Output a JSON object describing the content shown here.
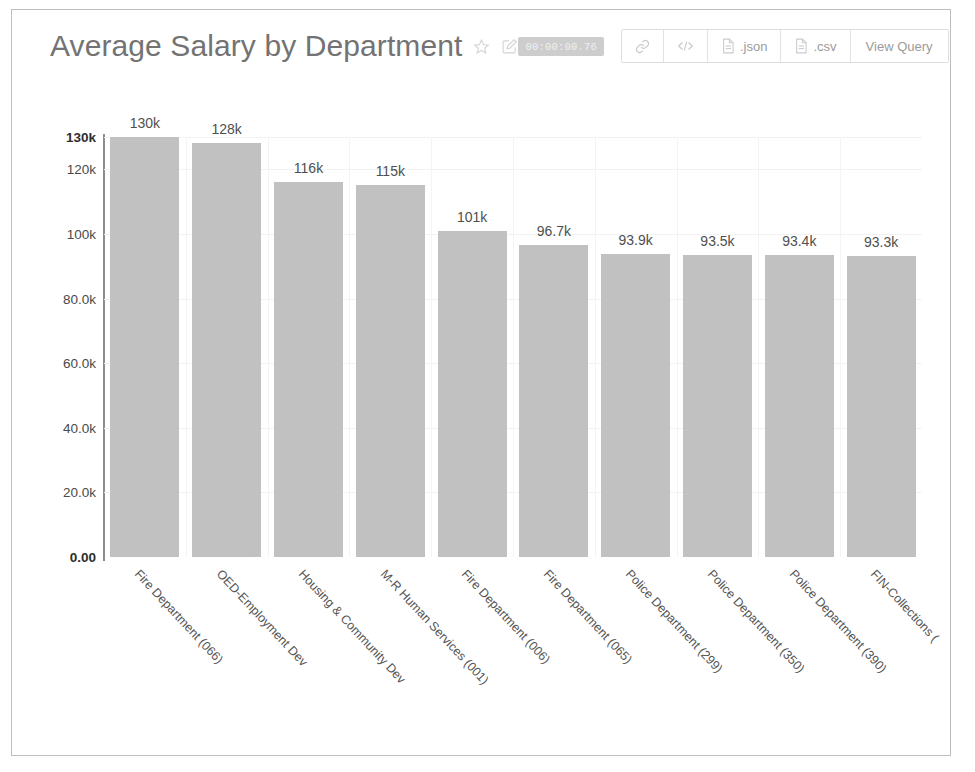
{
  "header": {
    "title": "Average Salary by Department",
    "favorite_icon": "star-icon",
    "edit_icon": "edit-square-icon",
    "timer": "00:00:00.76",
    "buttons": [
      {
        "name": "share-link-button",
        "icon": "link-icon",
        "label": ""
      },
      {
        "name": "embed-code-button",
        "icon": "code-icon",
        "label": ""
      },
      {
        "name": "download-json-button",
        "icon": "file-icon",
        "label": ".json"
      },
      {
        "name": "download-csv-button",
        "icon": "file-icon",
        "label": ".csv"
      },
      {
        "name": "view-query-button",
        "icon": "",
        "label": "View Query"
      }
    ]
  },
  "chart_data": {
    "type": "bar",
    "title": "Average Salary by Department",
    "xlabel": "",
    "ylabel": "",
    "ylim": [
      0,
      130000
    ],
    "grid": true,
    "legend": "none",
    "orientation": "vertical",
    "bar_color": "#c3c3c3",
    "categories": [
      "Fire Department (066)",
      "OED-Employment Dev",
      "Housing & Community Dev",
      "M-R Human Services (001)",
      "Fire Department (006)",
      "Fire Department (065)",
      "Police Department (299)",
      "Police Department (350)",
      "Police Department (390)",
      "FIN-Collections ("
    ],
    "values": [
      130000,
      128000,
      116000,
      115000,
      101000,
      96700,
      93900,
      93500,
      93400,
      93300
    ],
    "value_labels": [
      "130k",
      "128k",
      "116k",
      "115k",
      "101k",
      "96.7k",
      "93.9k",
      "93.5k",
      "93.4k",
      "93.3k"
    ],
    "y_ticks": [
      {
        "value": 130000,
        "label": "130k",
        "bold": true
      },
      {
        "value": 120000,
        "label": "120k",
        "bold": false
      },
      {
        "value": 100000,
        "label": "100k",
        "bold": false
      },
      {
        "value": 80000,
        "label": "80.0k",
        "bold": false
      },
      {
        "value": 60000,
        "label": "60.0k",
        "bold": false
      },
      {
        "value": 40000,
        "label": "40.0k",
        "bold": false
      },
      {
        "value": 20000,
        "label": "20.0k",
        "bold": false
      },
      {
        "value": 0,
        "label": "0.00",
        "bold": true
      }
    ]
  }
}
